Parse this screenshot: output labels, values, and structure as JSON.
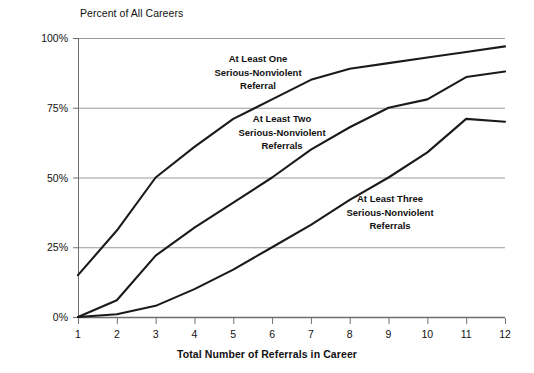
{
  "chart_data": {
    "type": "line",
    "title": "",
    "ylabel": "Percent of All Careers",
    "xlabel": "Total Number of Referrals in Career",
    "x": [
      1,
      2,
      3,
      4,
      5,
      6,
      7,
      8,
      9,
      10,
      11,
      12
    ],
    "xtick_labels": [
      "1",
      "2",
      "3",
      "4",
      "5",
      "6",
      "7",
      "8",
      "9",
      "10",
      "11",
      "12"
    ],
    "ytick_labels": [
      "0%",
      "25%",
      "50%",
      "75%",
      "100%"
    ],
    "ytick_values": [
      0,
      25,
      50,
      75,
      100
    ],
    "ylim": [
      0,
      100
    ],
    "xlim": [
      1,
      12
    ],
    "grid": "horizontal",
    "legend_position": "inline-annotations",
    "line_color": "#1a1a1a",
    "grid_color": "#9a9a9a",
    "axis_color": "#6e6e6e",
    "series": [
      {
        "name": "At Least One Serious-Nonviolent Referral",
        "label_lines": [
          "At Least One",
          "Serious-Nonviolent",
          "Referral"
        ],
        "values": [
          15,
          31,
          50,
          61,
          71,
          78,
          85,
          89,
          91,
          93,
          95,
          97
        ]
      },
      {
        "name": "At Least Two Serious-Nonviolent Referrals",
        "label_lines": [
          "At Least Two",
          "Serious-Nonviolent",
          "Referrals"
        ],
        "values": [
          0,
          6,
          22,
          32,
          41,
          50,
          60,
          68,
          75,
          78,
          86,
          88
        ]
      },
      {
        "name": "At Least Three Serious-Nonviolent Referrals",
        "label_lines": [
          "At Least Three",
          "Serious-Nonviolent",
          "Referrals"
        ],
        "values": [
          0,
          1,
          4,
          10,
          17,
          25,
          33,
          42,
          50,
          59,
          71,
          70
        ]
      }
    ],
    "annotations": [
      {
        "text_lines": [
          "At Least One",
          "Serious-Nonviolent",
          "Referral"
        ],
        "x_px": 258,
        "y_px": 52
      },
      {
        "text_lines": [
          "At Least Two",
          "Serious-Nonviolent",
          "Referrals"
        ],
        "x_px": 282,
        "y_px": 112
      },
      {
        "text_lines": [
          "At Least Three",
          "Serious-Nonviolent",
          "Referrals"
        ],
        "x_px": 390,
        "y_px": 192
      }
    ]
  }
}
